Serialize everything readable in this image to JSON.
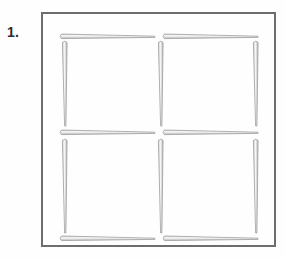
{
  "page": {
    "background_color": "#fefefe",
    "width": 285,
    "height": 259
  },
  "problem": {
    "number_label": "1.",
    "title": ""
  },
  "frame": {
    "name": "puzzle-frame",
    "border_color": "#6d6d6d",
    "border_width": 2,
    "x": 41,
    "y": 12,
    "width": 235,
    "height": 235
  },
  "puzzle": {
    "type": "matchstick-grid",
    "grid_rows": 2,
    "grid_cols": 2,
    "square_count": 4,
    "matchstick_count": 12,
    "stick_body_color": "#9a9a9a",
    "stick_fill_color": "#fafafa",
    "stick_head_color": "#8a8a8a"
  },
  "matchsticks": [
    {
      "id": "h-top-left",
      "orientation": "horizontal",
      "x": 18,
      "y": 21,
      "length": 95,
      "head": "start"
    },
    {
      "id": "h-top-right",
      "orientation": "horizontal",
      "x": 121,
      "y": 21,
      "length": 95,
      "head": "start"
    },
    {
      "id": "h-mid-left",
      "orientation": "horizontal",
      "x": 18,
      "y": 117,
      "length": 95,
      "head": "start"
    },
    {
      "id": "h-mid-right",
      "orientation": "horizontal",
      "x": 121,
      "y": 117,
      "length": 95,
      "head": "start"
    },
    {
      "id": "h-bottom-left",
      "orientation": "horizontal",
      "x": 18,
      "y": 223,
      "length": 95,
      "head": "start"
    },
    {
      "id": "h-bottom-right",
      "orientation": "horizontal",
      "x": 121,
      "y": 223,
      "length": 95,
      "head": "start"
    },
    {
      "id": "v-left-upper",
      "orientation": "vertical",
      "x": 21,
      "y": 28,
      "length": 88,
      "head": "start"
    },
    {
      "id": "v-mid-upper",
      "orientation": "vertical",
      "x": 117,
      "y": 28,
      "length": 88,
      "head": "start"
    },
    {
      "id": "v-right-upper",
      "orientation": "vertical",
      "x": 212,
      "y": 28,
      "length": 88,
      "head": "start"
    },
    {
      "id": "v-left-lower",
      "orientation": "vertical",
      "x": 21,
      "y": 126,
      "length": 95,
      "head": "start"
    },
    {
      "id": "v-mid-lower",
      "orientation": "vertical",
      "x": 117,
      "y": 126,
      "length": 95,
      "head": "start"
    },
    {
      "id": "v-right-lower",
      "orientation": "vertical",
      "x": 212,
      "y": 126,
      "length": 95,
      "head": "start"
    }
  ]
}
